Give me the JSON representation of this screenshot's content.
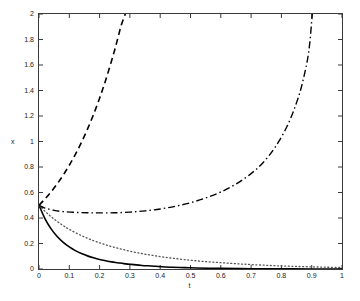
{
  "figure": {
    "background": "#ffffff",
    "axes_color": "#3a3a3a",
    "text_color": "#1a1a1a"
  },
  "chart_data": {
    "type": "line",
    "title": "",
    "xlabel": "t",
    "ylabel": "x",
    "xlim": [
      0,
      1
    ],
    "ylim": [
      0,
      2
    ],
    "grid": false,
    "legend": "none",
    "xticks": [
      "0",
      "0.1",
      "0.2",
      "0.3",
      "0.4",
      "0.5",
      "0.6",
      "0.7",
      "0.8",
      "0.9",
      "1"
    ],
    "xtick_values": [
      0,
      0.1,
      0.2,
      0.3,
      0.4,
      0.5,
      0.6,
      0.7,
      0.8,
      0.9,
      1
    ],
    "yticks": [
      "0",
      "0.2",
      "0.4",
      "0.6",
      "0.8",
      "1",
      "1.2",
      "1.4",
      "1.6",
      "1.8",
      "2"
    ],
    "ytick_values": [
      0,
      0.2,
      0.4,
      0.6,
      0.8,
      1,
      1.2,
      1.4,
      1.6,
      1.8,
      2
    ],
    "initial_condition": 0.5,
    "series": [
      {
        "name": "solid-curve",
        "style": "solid",
        "color": "#000000",
        "width": 1.6,
        "x": [
          0,
          0.02,
          0.04,
          0.06,
          0.08,
          0.1,
          0.12,
          0.14,
          0.16,
          0.18,
          0.2,
          0.22,
          0.24,
          0.26,
          0.28,
          0.3,
          0.32,
          0.34,
          0.36,
          0.38,
          0.4,
          0.44,
          0.48,
          0.52,
          0.56,
          0.6,
          0.7,
          0.8,
          0.9,
          1.0
        ],
        "y": [
          0.5,
          0.394,
          0.315,
          0.255,
          0.209,
          0.173,
          0.144,
          0.121,
          0.103,
          0.088,
          0.075,
          0.065,
          0.056,
          0.049,
          0.042,
          0.037,
          0.032,
          0.028,
          0.025,
          0.022,
          0.019,
          0.014,
          0.011,
          0.008,
          0.006,
          0.005,
          0.002,
          0.001,
          0.0,
          0.0
        ]
      },
      {
        "name": "dotted-curve",
        "style": "dotted",
        "color": "#555555",
        "width": 1.3,
        "x": [
          0,
          0.02,
          0.04,
          0.06,
          0.08,
          0.1,
          0.14,
          0.18,
          0.22,
          0.26,
          0.3,
          0.34,
          0.38,
          0.42,
          0.46,
          0.5,
          0.54,
          0.58,
          0.62,
          0.66,
          0.7,
          0.75,
          0.8,
          0.85,
          0.9,
          0.95,
          1.0
        ],
        "y": [
          0.5,
          0.452,
          0.41,
          0.373,
          0.34,
          0.311,
          0.262,
          0.222,
          0.19,
          0.163,
          0.14,
          0.121,
          0.105,
          0.091,
          0.079,
          0.069,
          0.06,
          0.053,
          0.046,
          0.04,
          0.035,
          0.029,
          0.024,
          0.02,
          0.017,
          0.014,
          0.012
        ]
      },
      {
        "name": "dashed-curve",
        "style": "dashed",
        "color": "#000000",
        "width": 1.6,
        "x": [
          0,
          0.02,
          0.04,
          0.06,
          0.08,
          0.1,
          0.12,
          0.14,
          0.16,
          0.18,
          0.2,
          0.22,
          0.24,
          0.25,
          0.26,
          0.27,
          0.28,
          0.285
        ],
        "y": [
          0.5,
          0.55,
          0.605,
          0.668,
          0.737,
          0.814,
          0.899,
          0.993,
          1.097,
          1.212,
          1.34,
          1.481,
          1.637,
          1.72,
          1.808,
          1.9,
          1.97,
          2.0
        ]
      },
      {
        "name": "dash-dot-curve",
        "style": "dashdot",
        "color": "#000000",
        "width": 1.4,
        "x": [
          0,
          0.02,
          0.05,
          0.08,
          0.12,
          0.16,
          0.2,
          0.25,
          0.3,
          0.35,
          0.4,
          0.45,
          0.5,
          0.55,
          0.6,
          0.65,
          0.7,
          0.74,
          0.78,
          0.82,
          0.85,
          0.87,
          0.89,
          0.902
        ],
        "y": [
          0.5,
          0.478,
          0.46,
          0.45,
          0.444,
          0.441,
          0.44,
          0.441,
          0.446,
          0.456,
          0.471,
          0.492,
          0.52,
          0.557,
          0.604,
          0.666,
          0.748,
          0.836,
          0.957,
          1.125,
          1.305,
          1.465,
          1.7,
          2.0
        ]
      }
    ]
  }
}
